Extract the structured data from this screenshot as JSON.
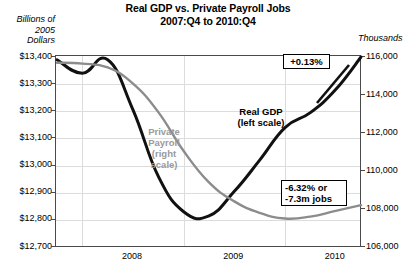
{
  "title": {
    "line1": "Real GDP vs. Private Payroll Jobs",
    "line2": "2007:Q4 to 2010:Q4"
  },
  "axis_units": {
    "left": "Billions of\n2005\nDollars",
    "left_l1": "Billions of",
    "left_l2": "2005",
    "left_l3": "Dollars",
    "right": "Thousands"
  },
  "series_labels": {
    "gdp_l1": "Real GDP",
    "gdp_l2": "(left scale)",
    "payroll_l1": "Private",
    "payroll_l2": "Payroll",
    "payroll_l3": "(right",
    "payroll_l4": "scale)"
  },
  "callouts": {
    "gdp": "+0.13%",
    "payroll_l1": "-6.32% or",
    "payroll_l2": "-7.3m jobs"
  },
  "colors": {
    "gdp": "#111111",
    "payroll": "#8c8c8c",
    "grid": "#dcdcdc",
    "frame": "#4a4a4a"
  },
  "chart_data": {
    "type": "line",
    "title": "Real GDP vs. Private Payroll Jobs 2007:Q4 to 2010:Q4",
    "xlabel": "",
    "ylabel": "Billions of 2005 Dollars",
    "y2label": "Thousands",
    "grid": true,
    "legend": "in-plot annotations",
    "x": [
      "2007:Q4",
      "2008:Q1",
      "2008:Q2",
      "2008:Q3",
      "2008:Q4",
      "2009:Q1",
      "2009:Q2",
      "2009:Q3",
      "2009:Q4",
      "2010:Q1",
      "2010:Q2",
      "2010:Q3",
      "2010:Q4"
    ],
    "xtick_labels": [
      "2008",
      "2009",
      "2010"
    ],
    "ylim": [
      12700,
      13400
    ],
    "yticks": [
      "$12,700",
      "$12,800",
      "$12,900",
      "$13,000",
      "$13,100",
      "$13,200",
      "$13,300",
      "$13,400"
    ],
    "y2lim": [
      106000,
      116000
    ],
    "y2ticks": [
      "106,000",
      "108,000",
      "110,000",
      "112,000",
      "114,000",
      "116,000"
    ],
    "series": [
      {
        "name": "Real GDP (left scale)",
        "axis": "left",
        "color": "#111111",
        "values": [
          13390,
          13340,
          13390,
          13205,
          12960,
          12830,
          12815,
          12905,
          13020,
          13140,
          13195,
          13280,
          13400
        ]
      },
      {
        "name": "Private Payroll (right scale)",
        "axis": "right",
        "color": "#8c8c8c",
        "values": [
          115700,
          115650,
          115450,
          114600,
          113100,
          111050,
          109400,
          108400,
          107800,
          107500,
          107600,
          107900,
          108200
        ]
      }
    ],
    "annotations": [
      {
        "text": "+0.13%",
        "refers_to": "Real GDP",
        "at": "2010:Q4"
      },
      {
        "text": "-6.32% or -7.3m jobs",
        "refers_to": "Private Payroll",
        "at": "2010:Q4"
      }
    ]
  }
}
